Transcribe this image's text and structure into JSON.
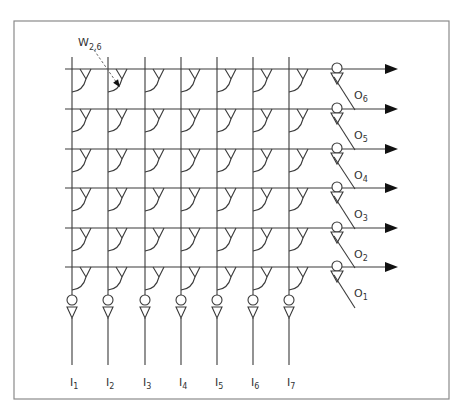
{
  "diagram": {
    "frame": {
      "x": 14,
      "y": 21,
      "width": 435,
      "height": 378
    },
    "colors": {
      "wire": "#3a3a3a",
      "frame": "#8a8a8a",
      "arrow": "#111111",
      "label": "#333333"
    },
    "grid": {
      "columns_x": [
        72,
        108,
        145,
        181,
        217,
        253,
        289
      ],
      "rows_y": [
        69,
        109,
        149,
        188,
        228,
        267
      ],
      "row_line_start_x": 65,
      "row_line_end_x": 388,
      "column_top_y": 57,
      "column_bottom_y": 365
    },
    "weight_label": {
      "text": "W",
      "subscript": "2,6",
      "x": 78,
      "y": 46
    },
    "weight_pointer": {
      "x1": 94,
      "y1": 50,
      "x2": 119,
      "y2": 86
    },
    "inputs": [
      {
        "label": "I",
        "subscript": "1"
      },
      {
        "label": "I",
        "subscript": "2"
      },
      {
        "label": "I",
        "subscript": "3"
      },
      {
        "label": "I",
        "subscript": "4"
      },
      {
        "label": "I",
        "subscript": "5"
      },
      {
        "label": "I",
        "subscript": "6"
      },
      {
        "label": "I",
        "subscript": "7"
      }
    ],
    "outputs": [
      {
        "label": "O",
        "subscript": "6"
      },
      {
        "label": "O",
        "subscript": "5"
      },
      {
        "label": "O",
        "subscript": "4"
      },
      {
        "label": "O",
        "subscript": "3"
      },
      {
        "label": "O",
        "subscript": "2"
      },
      {
        "label": "O",
        "subscript": "1"
      }
    ],
    "output_gate_x": 337,
    "input_gate_y": 300,
    "input_label_y": 386
  }
}
